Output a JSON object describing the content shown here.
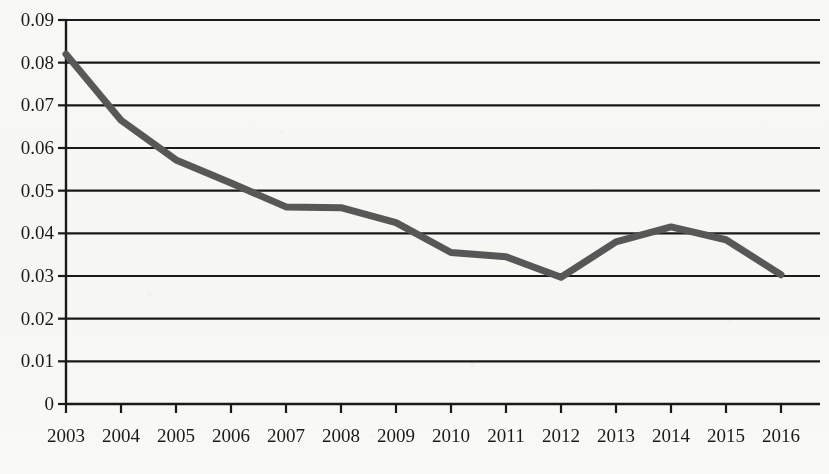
{
  "chart_data": {
    "type": "line",
    "title": "",
    "subtitle": "",
    "xlabel": "",
    "ylabel": "",
    "categories": [
      "2003",
      "2004",
      "2005",
      "2006",
      "2007",
      "2008",
      "2009",
      "2010",
      "2011",
      "2012",
      "2013",
      "2014",
      "2015",
      "2016"
    ],
    "values": [
      0.082,
      0.0665,
      0.0572,
      0.0518,
      0.0462,
      0.046,
      0.0425,
      0.0355,
      0.0345,
      0.0297,
      0.038,
      0.0415,
      0.0385,
      0.0303
    ],
    "series": [
      {
        "name": "",
        "values": [
          0.082,
          0.0665,
          0.0572,
          0.0518,
          0.0462,
          0.046,
          0.0425,
          0.0355,
          0.0345,
          0.0297,
          0.038,
          0.0415,
          0.0385,
          0.0303
        ],
        "color": "#595959"
      }
    ],
    "ylim": [
      0,
      0.09
    ],
    "ytick_labels": [
      "0.09",
      "0.08",
      "0.07",
      "0.06",
      "0.05",
      "0.04",
      "0.03",
      "0.02",
      "0.01",
      "0"
    ],
    "ytick_values": [
      0.09,
      0.08,
      0.07,
      0.06,
      0.05,
      0.04,
      0.03,
      0.02,
      0.01,
      0
    ],
    "xtick_labels": [
      "2003",
      "2004",
      "2005",
      "2006",
      "2007",
      "2008",
      "2009",
      "2010",
      "2011",
      "2012",
      "2013",
      "2014",
      "2015",
      "2016"
    ],
    "grid": true,
    "grid_axis": "y",
    "grid_color": "#1a1a1a",
    "legend": false,
    "legend_position": "none",
    "line_width_px": 7,
    "markers": false,
    "annotations": []
  },
  "axes": {
    "y_axis_line_color": "#1a1a1a",
    "x_axis_line_color": "#1a1a1a",
    "tick_direction": "out"
  },
  "geometry": {
    "plot_left": 66,
    "plot_right": 820,
    "plot_top": 20,
    "plot_bottom": 404,
    "x_step": 55.0,
    "y_per_unit": 4266.7
  }
}
